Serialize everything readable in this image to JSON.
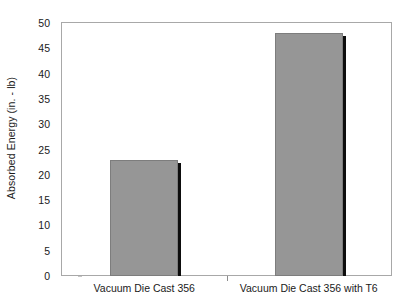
{
  "chart_data": {
    "type": "bar",
    "title": "",
    "subtitle": "",
    "xlabel": "",
    "ylabel": "Absorbed Energy (in. - lb)",
    "categories": [
      "Vacuum Die Cast 356",
      "Vacuum Die Cast 356 with T6"
    ],
    "values": [
      23,
      48
    ],
    "series": [
      {
        "name": "Absorbed Energy",
        "values": [
          23,
          48
        ]
      }
    ],
    "ylim": [
      0,
      50
    ],
    "ytick_interval": 5,
    "yticks": [
      "0",
      "5",
      "10",
      "15",
      "20",
      "25",
      "30",
      "35",
      "40",
      "45",
      "50"
    ],
    "ytick_values": [
      0,
      5,
      10,
      15,
      20,
      25,
      30,
      35,
      40,
      45,
      50
    ],
    "grid": false,
    "legend": false,
    "legend_position": "none",
    "bar_color": "#969696",
    "bar_border_color": "#7d7d7d",
    "bar_shadow_color": "#0d0d0d",
    "axis_color": "#a8a8a8",
    "text_color": "#1a1a1a",
    "background_color": "#ffffff"
  }
}
